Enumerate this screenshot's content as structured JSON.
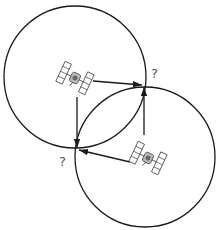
{
  "diagram": {
    "type": "satellite-ranging-intersection",
    "colors": {
      "stroke": "#1a1a1a",
      "label": "#555555",
      "background": "#ffffff"
    },
    "circles": [
      {
        "id": "range-circle-1",
        "cx": 75,
        "cy": 77,
        "r": 71
      },
      {
        "id": "range-circle-2",
        "cx": 145,
        "cy": 157,
        "r": 70
      }
    ],
    "satellites": [
      {
        "id": "satellite-1",
        "x": 75,
        "y": 78
      },
      {
        "id": "satellite-2",
        "x": 148,
        "y": 158
      }
    ],
    "arrows": [
      {
        "id": "arrow-sat1-to-upper-intersection",
        "from": [
          92,
          81
        ],
        "to": [
          143,
          85
        ]
      },
      {
        "id": "arrow-sat1-to-lower-intersection",
        "from": [
          77,
          97
        ],
        "to": [
          77,
          149
        ]
      },
      {
        "id": "arrow-sat2-to-upper-intersection",
        "from": [
          144,
          135
        ],
        "to": [
          144,
          86
        ]
      },
      {
        "id": "arrow-sat2-to-lower-intersection",
        "from": [
          130,
          162
        ],
        "to": [
          78,
          150
        ]
      }
    ],
    "labels": [
      {
        "id": "upper-intersection-label",
        "text": "?",
        "x": 151,
        "y": 67
      },
      {
        "id": "lower-intersection-label",
        "text": "?",
        "x": 59,
        "y": 155
      }
    ]
  }
}
